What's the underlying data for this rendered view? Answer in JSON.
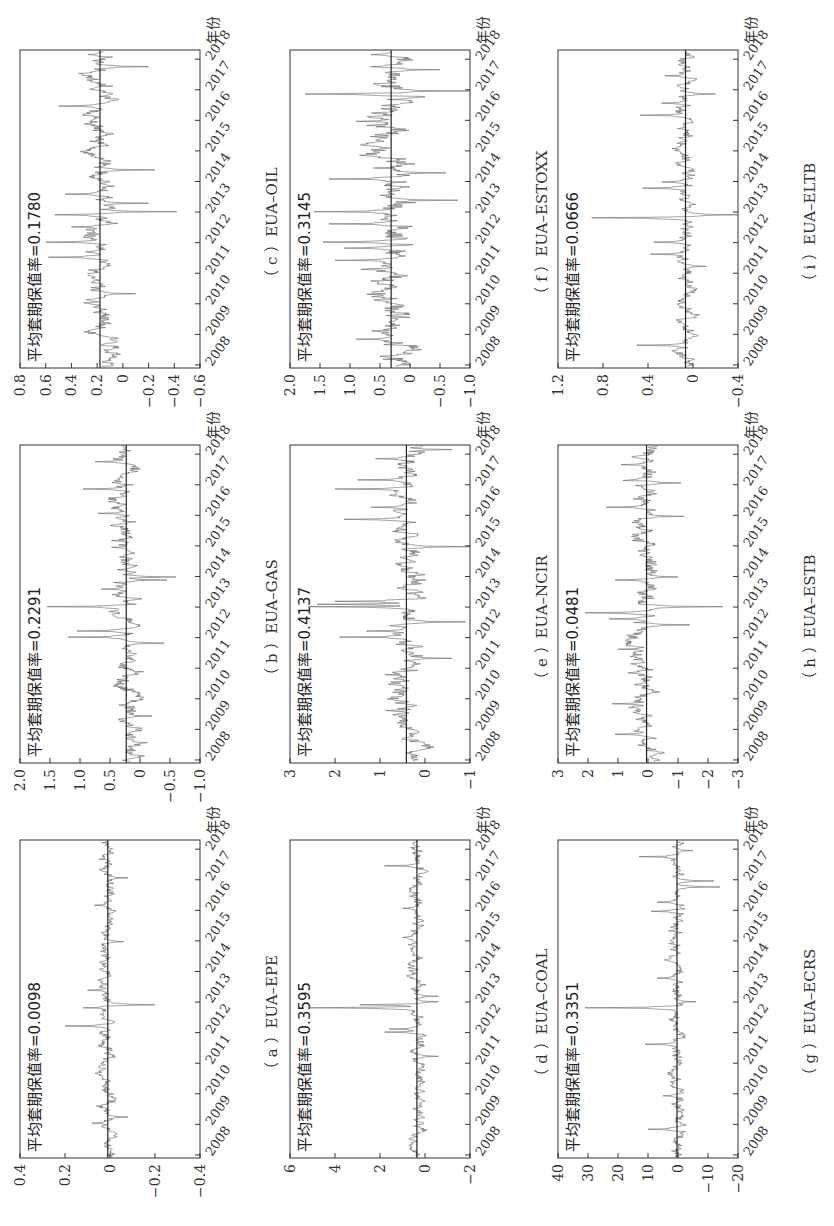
{
  "figure": {
    "orientation": "page rotated 90 degrees counter-clockwise",
    "x_axis_unit_label": "年份",
    "annotation_prefix": "平均套期保值率="
  },
  "chart_data": [
    {
      "id": "a",
      "type": "line",
      "caption": "（ a ）EUA–EPE",
      "title": "EUA–EPE",
      "annotation": "平均套期保值率=0.0098",
      "mean": 0.0098,
      "x": [
        "2008",
        "2009",
        "2010",
        "2011",
        "2012",
        "2013",
        "2014",
        "2015",
        "2016",
        "2017",
        "2018"
      ],
      "xlabel": "年份",
      "ylabel": "",
      "ylim": [
        -0.4,
        0.4
      ],
      "yticks": [
        "0.4",
        "0.2",
        "0",
        "−0.2",
        "−0.4"
      ],
      "ytick_values": [
        0.4,
        0.2,
        0,
        -0.2,
        -0.4
      ],
      "series_profile": {
        "base_amp": 0.02,
        "spikes": [
          [
            2012.2,
            0.2
          ],
          [
            2012.9,
            -0.2
          ],
          [
            2012.8,
            0.12
          ],
          [
            2013.4,
            0.1
          ],
          [
            2009.0,
            0.08
          ],
          [
            2009.2,
            -0.08
          ],
          [
            2016.2,
            0.07
          ],
          [
            2017.1,
            -0.08
          ],
          [
            2015.0,
            -0.06
          ]
        ],
        "seed": 11
      }
    },
    {
      "id": "b",
      "type": "line",
      "caption": "（ b ）EUA–GAS",
      "title": "EUA–GAS",
      "annotation": "平均套期保值率=0.2291",
      "mean": 0.2291,
      "x": [
        "2008",
        "2009",
        "2010",
        "2011",
        "2012",
        "2013",
        "2014",
        "2015",
        "2016",
        "2017",
        "2018"
      ],
      "xlabel": "年份",
      "ylabel": "",
      "ylim": [
        -1.0,
        2.0
      ],
      "yticks": [
        "2.0",
        "1.5",
        "1.0",
        "0.5",
        "0",
        "−0.5",
        "−1.0"
      ],
      "ytick_values": [
        2.0,
        1.5,
        1.0,
        0.5,
        0,
        -0.5,
        -1.0
      ],
      "series_profile": {
        "base_amp": 0.12,
        "spikes": [
          [
            2012.0,
            1.2
          ],
          [
            2012.2,
            1.05
          ],
          [
            2013.0,
            1.55
          ],
          [
            2013.6,
            0.65
          ],
          [
            2014.0,
            -0.6
          ],
          [
            2013.9,
            -0.45
          ],
          [
            2011.8,
            -0.4
          ],
          [
            2016.1,
            0.7
          ],
          [
            2016.9,
            0.95
          ],
          [
            2017.8,
            0.75
          ],
          [
            2009.4,
            -0.2
          ]
        ],
        "seed": 23
      }
    },
    {
      "id": "c",
      "type": "line",
      "caption": "（ c ）EUA–OIL",
      "title": "EUA–OIL",
      "annotation": "平均套期保值率=0.1780",
      "mean": 0.178,
      "x": [
        "2008",
        "2009",
        "2010",
        "2011",
        "2012",
        "2013",
        "2014",
        "2015",
        "2016",
        "2017",
        "2018"
      ],
      "xlabel": "年份",
      "ylabel": "",
      "ylim": [
        -0.6,
        0.8
      ],
      "yticks": [
        "0.8",
        "0.6",
        "0.4",
        "0.2",
        "0",
        "−0.2",
        "−0.4",
        "−0.6"
      ],
      "ytick_values": [
        0.8,
        0.6,
        0.4,
        0.2,
        0,
        -0.6
      ],
      "series_profile": {
        "base_amp": 0.06,
        "spikes": [
          [
            2011.5,
            0.58
          ],
          [
            2012.0,
            0.6
          ],
          [
            2012.5,
            0.4
          ],
          [
            2012.9,
            0.53
          ],
          [
            2013.0,
            -0.42
          ],
          [
            2013.3,
            -0.2
          ],
          [
            2013.6,
            0.45
          ],
          [
            2014.4,
            -0.25
          ],
          [
            2016.5,
            0.5
          ],
          [
            2017.8,
            -0.2
          ],
          [
            2018.2,
            0.27
          ],
          [
            2010.3,
            -0.1
          ]
        ],
        "seed": 37
      }
    },
    {
      "id": "d",
      "type": "line",
      "caption": "（ d ）EUA–COAL",
      "title": "EUA–COAL",
      "annotation": "平均套期保值率=0.3595",
      "mean": 0.3595,
      "x": [
        "2008",
        "2009",
        "2010",
        "2011",
        "2012",
        "2013",
        "2014",
        "2015",
        "2016",
        "2017",
        "2018"
      ],
      "xlabel": "年份",
      "ylabel": "",
      "ylim": [
        -2,
        6
      ],
      "yticks": [
        "6",
        "4",
        "2",
        "0",
        "−2"
      ],
      "ytick_values": [
        6,
        4,
        2,
        0,
        -2
      ],
      "series_profile": {
        "base_amp": 0.2,
        "spikes": [
          [
            2012.0,
            1.8
          ],
          [
            2012.1,
            1.6
          ],
          [
            2012.8,
            5.1
          ],
          [
            2012.9,
            2.9
          ],
          [
            2013.0,
            -0.6
          ],
          [
            2013.2,
            -0.6
          ],
          [
            2017.5,
            1.8
          ],
          [
            2016.1,
            1.0
          ],
          [
            2011.2,
            -0.6
          ]
        ],
        "seed": 41
      }
    },
    {
      "id": "e",
      "type": "line",
      "caption": "（ e ）EUA–NCIR",
      "title": "EUA–NCIR",
      "annotation": "平均套期保值率=0.4137",
      "mean": 0.4137,
      "x": [
        "2008",
        "2009",
        "2010",
        "2011",
        "2012",
        "2013",
        "2014",
        "2015",
        "2016",
        "2017",
        "2018"
      ],
      "xlabel": "年份",
      "ylabel": "",
      "ylim": [
        -1,
        3
      ],
      "yticks": [
        "3",
        "2",
        "1",
        "0",
        "−1"
      ],
      "ytick_values": [
        3,
        2,
        1,
        0,
        -1
      ],
      "series_profile": {
        "base_amp": 0.2,
        "spikes": [
          [
            2012.0,
            1.9
          ],
          [
            2012.2,
            1.3
          ],
          [
            2013.0,
            2.6
          ],
          [
            2013.1,
            2.4
          ],
          [
            2013.2,
            2.0
          ],
          [
            2012.5,
            -0.9
          ],
          [
            2011.3,
            -0.6
          ],
          [
            2015.0,
            -1.0
          ],
          [
            2015.9,
            1.8
          ],
          [
            2016.3,
            1.2
          ],
          [
            2016.9,
            2.0
          ],
          [
            2017.2,
            1.5
          ],
          [
            2017.9,
            1.1
          ],
          [
            2018.2,
            -0.6
          ]
        ],
        "seed": 53
      }
    },
    {
      "id": "f",
      "type": "line",
      "caption": "（ f ）EUA–ESTOXX",
      "title": "EUA–ESTOXX",
      "annotation": "平均套期保值率=0.3145",
      "mean": 0.3145,
      "x": [
        "2008",
        "2009",
        "2010",
        "2011",
        "2012",
        "2013",
        "2014",
        "2015",
        "2016",
        "2017",
        "2018"
      ],
      "xlabel": "年份",
      "ylabel": "",
      "ylim": [
        -1.0,
        2.0
      ],
      "yticks": [
        "2.0",
        "1.5",
        "1.0",
        "0.5",
        "0",
        "−0.5",
        "−1.0"
      ],
      "ytick_values": [
        2.0,
        1.5,
        1.0,
        0.5,
        0,
        -0.5,
        -1.0
      ],
      "series_profile": {
        "base_amp": 0.2,
        "spikes": [
          [
            2008.8,
            0.9
          ],
          [
            2011.4,
            1.25
          ],
          [
            2011.8,
            1.1
          ],
          [
            2012.0,
            1.45
          ],
          [
            2012.6,
            1.35
          ],
          [
            2013.0,
            1.6
          ],
          [
            2013.4,
            -0.8
          ],
          [
            2014.1,
            1.35
          ],
          [
            2014.3,
            -0.6
          ],
          [
            2016.0,
            0.9
          ],
          [
            2016.9,
            1.75
          ],
          [
            2017.0,
            -1.0
          ],
          [
            2017.7,
            -0.5
          ],
          [
            2018.2,
            0.65
          ]
        ],
        "seed": 67
      }
    },
    {
      "id": "g",
      "type": "line",
      "caption": "（ g ）EUA–ECRS",
      "title": "EUA–ECRS",
      "annotation": "平均套期保值率=0.3351",
      "mean": 0.3351,
      "x": [
        "2008",
        "2009",
        "2010",
        "2011",
        "2012",
        "2013",
        "2014",
        "2015",
        "2016",
        "2017",
        "2018"
      ],
      "xlabel": "年份",
      "ylabel": "",
      "ylim": [
        -20,
        40
      ],
      "yticks": [
        "40",
        "30",
        "20",
        "10",
        "0",
        "−10",
        "−20"
      ],
      "ytick_values": [
        40,
        30,
        20,
        10,
        0,
        -10,
        -20
      ],
      "series_profile": {
        "base_amp": 1.5,
        "spikes": [
          [
            2008.8,
            10
          ],
          [
            2009.9,
            5
          ],
          [
            2011.6,
            11
          ],
          [
            2012.8,
            31
          ],
          [
            2013.0,
            -6
          ],
          [
            2013.8,
            7
          ],
          [
            2016.0,
            9
          ],
          [
            2016.3,
            7
          ],
          [
            2016.8,
            -14
          ],
          [
            2017.0,
            -12
          ],
          [
            2017.8,
            13
          ],
          [
            2018.0,
            -5
          ]
        ],
        "seed": 79
      }
    },
    {
      "id": "h",
      "type": "line",
      "caption": "（ h ）EUA–ESTB",
      "title": "EUA–ESTB",
      "annotation": "平均套期保值率=0.0481",
      "mean": 0.0481,
      "x": [
        "2008",
        "2009",
        "2010",
        "2011",
        "2012",
        "2013",
        "2014",
        "2015",
        "2016",
        "2017",
        "2018"
      ],
      "xlabel": "年份",
      "ylabel": "",
      "ylim": [
        -3,
        3
      ],
      "yticks": [
        "3",
        "2",
        "1",
        "0",
        "−1",
        "−2",
        "−3"
      ],
      "ytick_values": [
        3,
        2,
        1,
        0,
        -1,
        -2,
        -3
      ],
      "series_profile": {
        "base_amp": 0.25,
        "spikes": [
          [
            2008.8,
            1.1
          ],
          [
            2009.8,
            1.2
          ],
          [
            2011.6,
            1.0
          ],
          [
            2012.4,
            -1.4
          ],
          [
            2012.6,
            1.3
          ],
          [
            2012.8,
            2.1
          ],
          [
            2013.0,
            -2.5
          ],
          [
            2013.9,
            1.1
          ],
          [
            2014.0,
            -1.0
          ],
          [
            2016.0,
            -1.2
          ],
          [
            2016.3,
            1.4
          ],
          [
            2017.1,
            -1.1
          ],
          [
            2017.7,
            0.9
          ]
        ],
        "seed": 97
      }
    },
    {
      "id": "i",
      "type": "line",
      "caption": "（ i ）EUA–ELTB",
      "title": "EUA–ELTB",
      "annotation": "平均套期保值率=0.0666",
      "mean": 0.0666,
      "x": [
        "2008",
        "2009",
        "2010",
        "2011",
        "2012",
        "2013",
        "2014",
        "2015",
        "2016",
        "2017",
        "2018"
      ],
      "xlabel": "年份",
      "ylabel": "",
      "ylim": [
        -0.4,
        1.2
      ],
      "yticks": [
        "1.2",
        "0.8",
        "0.4",
        "0",
        "−0.4"
      ],
      "ytick_values": [
        1.2,
        0.8,
        0.4,
        0,
        -0.4
      ],
      "series_profile": {
        "base_amp": 0.05,
        "spikes": [
          [
            2008.6,
            0.5
          ],
          [
            2011.6,
            0.38
          ],
          [
            2012.0,
            0.35
          ],
          [
            2012.8,
            0.9
          ],
          [
            2012.9,
            -0.4
          ],
          [
            2013.8,
            0.45
          ],
          [
            2014.0,
            0.28
          ],
          [
            2016.2,
            0.47
          ],
          [
            2016.6,
            0.28
          ],
          [
            2016.9,
            -0.2
          ],
          [
            2017.5,
            0.25
          ],
          [
            2011.2,
            -0.12
          ]
        ],
        "seed": 113
      }
    }
  ]
}
